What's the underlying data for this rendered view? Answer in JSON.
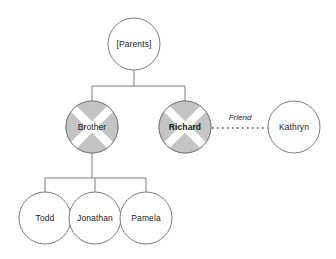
{
  "diagram": {
    "type": "family-genogram",
    "title": "",
    "background_color": "#ffffff",
    "stroke_color": "#7d7d7d",
    "wedge_fill_color": "#c4c4c4",
    "text_color": "#1a1a1a",
    "node_radius": 26,
    "nodes": [
      {
        "id": "parents",
        "label": "[Parents]",
        "shape": "circle",
        "style": "plain",
        "bold": false,
        "cx": 134,
        "cy": 44,
        "r": 26
      },
      {
        "id": "brother",
        "label": "Brother",
        "shape": "circle",
        "style": "crossed-wedges",
        "bold": false,
        "cx": 92,
        "cy": 127,
        "r": 26
      },
      {
        "id": "richard",
        "label": "Richard",
        "shape": "circle",
        "style": "crossed-wedges",
        "bold": true,
        "cx": 185,
        "cy": 127,
        "r": 26
      },
      {
        "id": "kathryn",
        "label": "Kathryn",
        "shape": "circle",
        "style": "plain",
        "bold": false,
        "cx": 294,
        "cy": 127,
        "r": 26
      },
      {
        "id": "todd",
        "label": "Todd",
        "shape": "circle",
        "style": "plain",
        "bold": false,
        "cx": 45,
        "cy": 218,
        "r": 26
      },
      {
        "id": "jonathan",
        "label": "Jonathan",
        "shape": "circle",
        "style": "plain",
        "bold": false,
        "cx": 95,
        "cy": 218,
        "r": 26
      },
      {
        "id": "pamela",
        "label": "Pamela",
        "shape": "circle",
        "style": "plain",
        "bold": false,
        "cx": 146,
        "cy": 218,
        "r": 26
      }
    ],
    "edges": [
      {
        "id": "parents-to-children",
        "from": "parents",
        "to": "brother,richard",
        "style": "solid",
        "label": ""
      },
      {
        "id": "brother-to-children",
        "from": "brother",
        "to": "todd,jonathan,pamela",
        "style": "solid",
        "label": ""
      },
      {
        "id": "richard-kathryn",
        "from": "richard",
        "to": "kathryn",
        "style": "dotted",
        "label": "Friend",
        "label_x": 240,
        "label_y": 118
      }
    ]
  }
}
